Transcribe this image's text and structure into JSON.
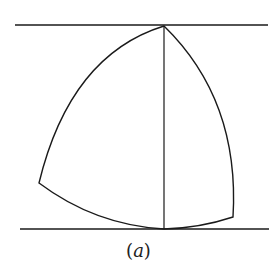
{
  "figure": {
    "caption_open": "(",
    "caption_letter": "a",
    "caption_close": ")",
    "stroke_color": "#1a1a1a"
  }
}
